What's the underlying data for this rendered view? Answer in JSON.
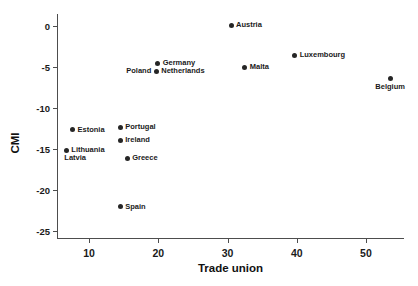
{
  "chart_data": {
    "type": "scatter",
    "title": "",
    "xlabel": "Trade union",
    "ylabel": "CMI",
    "xlim": [
      5.5,
      55.5
    ],
    "ylim": [
      -25.8,
      1.5
    ],
    "grid": false,
    "legend": null,
    "xticks": [
      10,
      20,
      30,
      40,
      50
    ],
    "xtick_labels": [
      "10",
      "20",
      "30",
      "40",
      "50"
    ],
    "yticks": [
      0,
      -5,
      -10,
      -15,
      -20,
      -25
    ],
    "ytick_labels": [
      "0",
      "-5",
      "-10",
      "-15",
      "-20",
      "-25"
    ],
    "points": [
      {
        "label": "Austria",
        "x": 30.5,
        "y": 0.1,
        "label_pos": "right"
      },
      {
        "label": "Luxembourg",
        "x": 39.7,
        "y": -3.5,
        "label_pos": "right"
      },
      {
        "label": "Germany",
        "x": 19.9,
        "y": -4.5,
        "label_pos": "right"
      },
      {
        "label": "Malta",
        "x": 32.5,
        "y": -5.0,
        "label_pos": "right"
      },
      {
        "label": "Netherlands",
        "x": 19.7,
        "y": -5.5,
        "label_pos": "right"
      },
      {
        "label": "Poland",
        "x": 19.7,
        "y": -5.5,
        "label_pos": "left"
      },
      {
        "label": "Belgium",
        "x": 53.5,
        "y": -6.3,
        "label_pos": "below"
      },
      {
        "label": "Portugal",
        "x": 14.5,
        "y": -12.3,
        "label_pos": "right"
      },
      {
        "label": "Estonia",
        "x": 7.6,
        "y": -12.6,
        "label_pos": "right"
      },
      {
        "label": "Ireland",
        "x": 14.5,
        "y": -13.9,
        "label_pos": "right"
      },
      {
        "label": "Lithuania",
        "x": 6.7,
        "y": -15.1,
        "label_pos": "right"
      },
      {
        "label": "Latvia",
        "x": 6.7,
        "y": -15.1,
        "label_pos": "below-right"
      },
      {
        "label": "Greece",
        "x": 15.5,
        "y": -16.1,
        "label_pos": "right"
      },
      {
        "label": "Spain",
        "x": 14.5,
        "y": -22.0,
        "label_pos": "right"
      }
    ],
    "marker_color": "#262626",
    "axis_color": "#4d4d4d",
    "background_color": "#ffffff"
  }
}
